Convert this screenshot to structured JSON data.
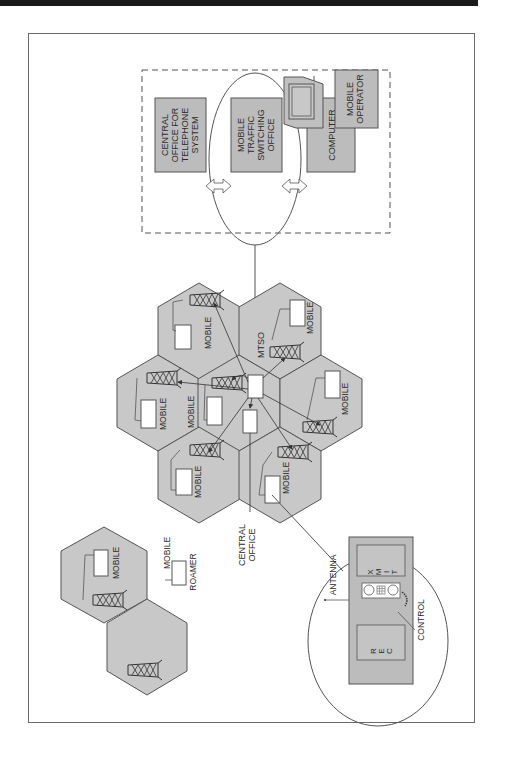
{
  "colors": {
    "hex_fill": "#c8c8c8",
    "box_fill": "#bcbcbc",
    "outline": "#555555",
    "background": "#ffffff",
    "top_bar": "#1a1a1a"
  },
  "control_center": {
    "boundary": "dashed",
    "central_office_box": [
      "CENTRAL",
      "OFFICE FOR",
      "TELEPHONE",
      "SYSTEM"
    ],
    "mtso_box": [
      "MOBILE",
      "TRAFFIC",
      "SWITCHING",
      "OFFICE"
    ],
    "computer_box": [
      "COMPUTER"
    ],
    "operator_box": [
      "MOBILE",
      "OPERATOR"
    ],
    "terminal_icon": "monitor-icon"
  },
  "cell_cluster": {
    "mtso_label": "MTSO",
    "central_office_label": [
      "CENTRAL",
      "OFFICE"
    ],
    "cells": [
      {
        "id": "top-left",
        "mobile_label": "MOBILE"
      },
      {
        "id": "top-right",
        "mobile_label": "MOBILE"
      },
      {
        "id": "mid-left",
        "mobile_label": "MOBILE"
      },
      {
        "id": "center",
        "mobile_label": "MOBILE"
      },
      {
        "id": "mid-right",
        "mobile_label": "MOBILE"
      },
      {
        "id": "bottom-left",
        "mobile_label": "MOBILE"
      },
      {
        "id": "bottom-right",
        "mobile_label": "MOBILE"
      }
    ]
  },
  "roamer_area": {
    "cell_mobile_label": "MOBILE",
    "legend_mobile": "MOBILE",
    "legend_roamer": "ROAMER"
  },
  "mobile_unit_detail": {
    "antenna_label": "ANTENNA",
    "xmit_label": [
      "X",
      "M",
      "I",
      "T"
    ],
    "rec_label": [
      "R",
      "E",
      "C"
    ],
    "control_label": "CONTROL"
  }
}
